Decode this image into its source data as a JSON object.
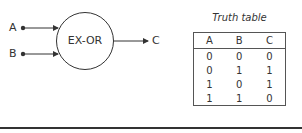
{
  "gate": {
    "label": "EX-OR",
    "inputs": [
      {
        "name": "A"
      },
      {
        "name": "B"
      }
    ],
    "output": {
      "name": "C"
    }
  },
  "truth_table": {
    "title": "Truth table",
    "headers": [
      "A",
      "B",
      "C"
    ],
    "rows": [
      [
        "0",
        "0",
        "0"
      ],
      [
        "0",
        "1",
        "1"
      ],
      [
        "1",
        "0",
        "1"
      ],
      [
        "1",
        "1",
        "0"
      ]
    ]
  },
  "colors": {
    "stroke": "#333333",
    "background": "#ffffff"
  }
}
